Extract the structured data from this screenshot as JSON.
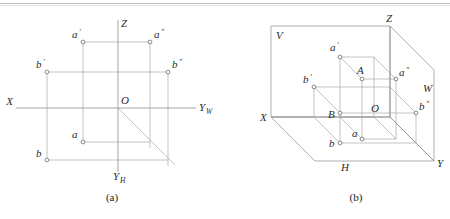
{
  "figure": {
    "caption_a": "(a)",
    "caption_b": "(b)",
    "line_color": "#8d8d8d",
    "label_color": "#2b2b2b",
    "background": "#ffffff"
  },
  "diagram_a": {
    "name": "two-dimensional projection layout",
    "axes": [
      {
        "id": "x",
        "label": "X",
        "sub": ""
      },
      {
        "id": "z",
        "label": "Z",
        "sub": ""
      },
      {
        "id": "yw",
        "label": "Y",
        "sub": "W"
      },
      {
        "id": "yh",
        "label": "Y",
        "sub": "H"
      }
    ],
    "origin": {
      "label": "O"
    },
    "points": [
      {
        "id": "a-prime",
        "label": "a",
        "prime": "′",
        "x": 83,
        "y": 42
      },
      {
        "id": "a-double",
        "label": "a",
        "prime": "″",
        "x": 150,
        "y": 42
      },
      {
        "id": "b-prime",
        "label": "b",
        "prime": "′",
        "x": 47,
        "y": 72
      },
      {
        "id": "b-double",
        "label": "b",
        "prime": "″",
        "x": 168,
        "y": 72
      },
      {
        "id": "a",
        "label": "a",
        "prime": "",
        "x": 83,
        "y": 142
      },
      {
        "id": "b",
        "label": "b",
        "prime": "",
        "x": 47,
        "y": 160
      }
    ]
  },
  "diagram_b": {
    "name": "three-dimensional axonometric projection planes",
    "planes": [
      {
        "id": "v-plane",
        "label": "V"
      },
      {
        "id": "h-plane",
        "label": "H"
      },
      {
        "id": "w-plane",
        "label": "W"
      }
    ],
    "axes": [
      {
        "id": "x",
        "label": "X"
      },
      {
        "id": "y",
        "label": "Y"
      },
      {
        "id": "z",
        "label": "Z"
      }
    ],
    "origin": {
      "label": "O"
    },
    "points": [
      {
        "id": "A",
        "label": "A",
        "prime": ""
      },
      {
        "id": "B",
        "label": "B",
        "prime": ""
      },
      {
        "id": "a-prime",
        "label": "a",
        "prime": "′"
      },
      {
        "id": "a-double",
        "label": "a",
        "prime": "″"
      },
      {
        "id": "a",
        "label": "a",
        "prime": ""
      },
      {
        "id": "b-prime",
        "label": "b",
        "prime": "′"
      },
      {
        "id": "b-double",
        "label": "b",
        "prime": "″"
      },
      {
        "id": "b",
        "label": "b",
        "prime": ""
      }
    ]
  }
}
